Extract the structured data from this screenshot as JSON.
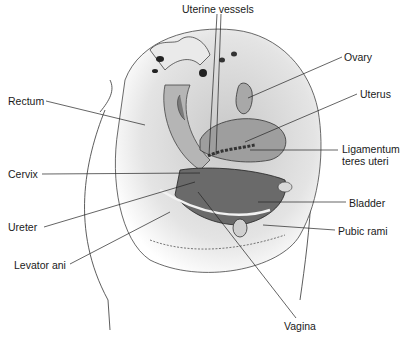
{
  "figure": {
    "type": "anatomical-illustration",
    "colors": {
      "background": "#ffffff",
      "ink": "#1a1a1a",
      "tissue_dark": "#5a5a5a",
      "tissue_mid": "#9a9a9a",
      "tissue_light": "#d4d4d4"
    }
  },
  "labels": [
    {
      "id": "uterine-vessels",
      "text": "Uterine vessels",
      "x": 182,
      "y": 3
    },
    {
      "id": "ovary",
      "text": "Ovary",
      "x": 344,
      "y": 53
    },
    {
      "id": "rectum",
      "text": "Rectum",
      "x": 8,
      "y": 96
    },
    {
      "id": "uterus",
      "text": "Uterus",
      "x": 360,
      "y": 90
    },
    {
      "id": "ligamentum",
      "text": "Ligamentum",
      "x": 342,
      "y": 147
    },
    {
      "id": "ligamentum-2",
      "text": "teres uteri",
      "x": 342,
      "y": 159
    },
    {
      "id": "cervix",
      "text": "Cervix",
      "x": 8,
      "y": 170
    },
    {
      "id": "bladder",
      "text": "Bladder",
      "x": 349,
      "y": 198
    },
    {
      "id": "ureter",
      "text": "Ureter",
      "x": 8,
      "y": 222
    },
    {
      "id": "pubic-rami",
      "text": "Pubic rami",
      "x": 338,
      "y": 226
    },
    {
      "id": "levator-ani",
      "text": "Levator ani",
      "x": 14,
      "y": 260
    },
    {
      "id": "vagina",
      "text": "Vagina",
      "x": 284,
      "y": 322
    }
  ]
}
